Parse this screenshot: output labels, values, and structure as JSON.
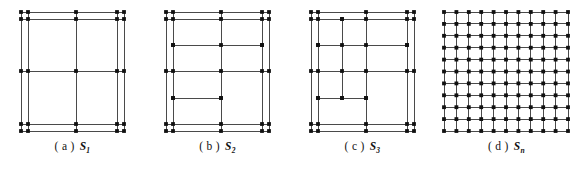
{
  "figure": {
    "type": "diagram",
    "line_color": "#4a4a4a",
    "node_color": "#111111",
    "background": "#ffffff",
    "node_radius": 1.9,
    "stroke_width": 1.0,
    "panel_width": 145,
    "panel_height": 177
  },
  "panels": [
    {
      "key": "a",
      "caption_label": "( a )",
      "caption_symbol": "S",
      "caption_subscript": "1",
      "offset_x": 0,
      "frame": {
        "x0": 21,
        "y0": 12,
        "x1": 124,
        "y1": 131,
        "inset": 7
      },
      "verticals": [
        21,
        28,
        76,
        117,
        124
      ],
      "horizontals": [
        12,
        19,
        71,
        124,
        131
      ],
      "extra_segments": []
    },
    {
      "key": "b",
      "caption_label": "( b )",
      "caption_symbol": "S",
      "caption_subscript": "2",
      "offset_x": 145,
      "frame": {
        "x0": 21,
        "y0": 12,
        "x1": 124,
        "y1": 131,
        "inset": 7
      },
      "verticals": [
        21,
        28,
        76,
        117,
        124
      ],
      "horizontals": [
        12,
        19,
        71,
        124,
        131
      ],
      "extra_segments": [
        {
          "orient": "h",
          "y": 45,
          "x_start": 28,
          "x_end": 117
        },
        {
          "orient": "h",
          "y": 98,
          "x_start": 28,
          "x_end": 76
        }
      ]
    },
    {
      "key": "c",
      "caption_label": "( c )",
      "caption_symbol": "S",
      "caption_subscript": "3",
      "offset_x": 290,
      "frame": {
        "x0": 21,
        "y0": 12,
        "x1": 124,
        "y1": 131,
        "inset": 7
      },
      "verticals": [
        21,
        28,
        76,
        117,
        124
      ],
      "horizontals": [
        12,
        19,
        71,
        124,
        131
      ],
      "extra_segments": [
        {
          "orient": "h",
          "y": 45,
          "x_start": 28,
          "x_end": 117
        },
        {
          "orient": "h",
          "y": 98,
          "x_start": 28,
          "x_end": 76
        },
        {
          "orient": "v",
          "x": 52,
          "y_start": 19,
          "y_end": 98
        }
      ]
    },
    {
      "key": "d",
      "caption_label": "( d )",
      "caption_symbol": "S",
      "caption_subscript": "n",
      "offset_x": 434,
      "frame": {
        "x0": 10,
        "y0": 12,
        "x1": 134,
        "y1": 131,
        "inset": 0
      },
      "grid_columns": 11,
      "grid_rows": 11,
      "verticals": [],
      "horizontals": [],
      "extra_segments": []
    }
  ]
}
